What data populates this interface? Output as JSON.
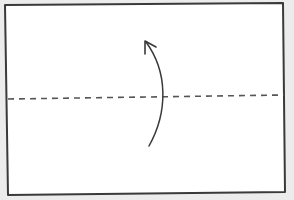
{
  "diagram": {
    "type": "origami-fold-step",
    "colors": {
      "background": "#ececec",
      "paper": "#ffffff",
      "stroke": "#3a3a3a",
      "fold_line": "#555555"
    },
    "sheet": {
      "x1": 6,
      "y1": 4,
      "x2": 285,
      "y2": 194
    },
    "fold_line": {
      "style": "dashed",
      "y_left": 99,
      "y_right": 95
    },
    "arrow": {
      "direction": "up",
      "label": "fold-up"
    }
  }
}
